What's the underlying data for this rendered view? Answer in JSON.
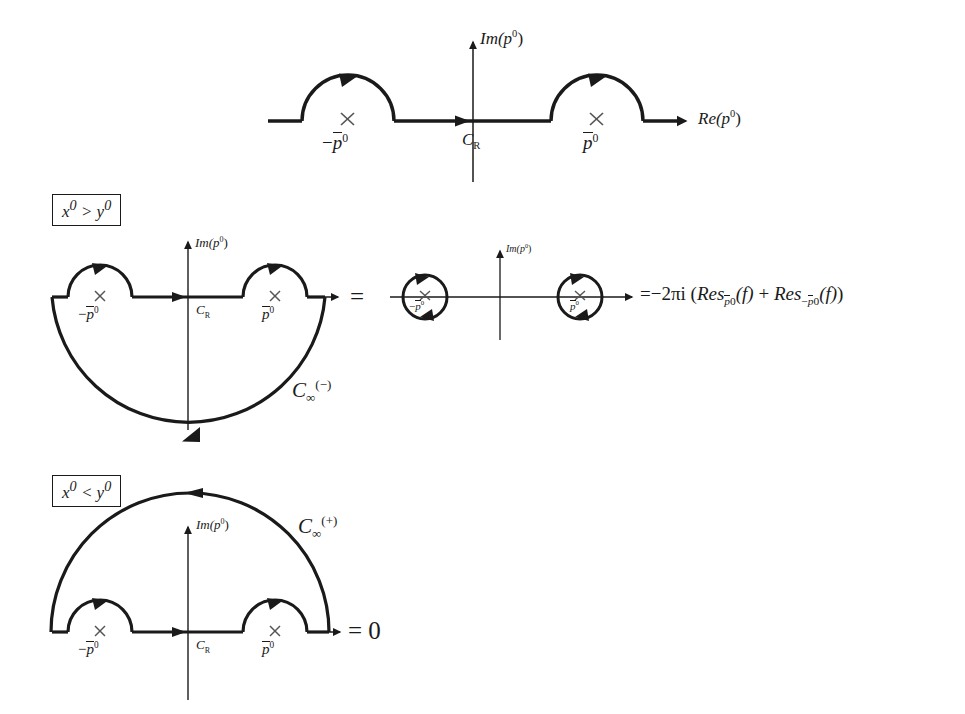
{
  "figure": {
    "background_color": "#ffffff",
    "ink_color": "#1a1a1a"
  },
  "labels": {
    "im_axis": "Im(p",
    "im_axis_sup": "0",
    "im_axis_close": ")",
    "re_axis": "Re(p",
    "re_axis_sup": "0",
    "re_axis_close": ")",
    "contour_cr": "C",
    "contour_cr_sub": "R",
    "pole_pos": "p",
    "pole_pos_sup": "0",
    "pole_neg_prefix": "−",
    "pole_neg": "p",
    "pole_neg_sup": "0",
    "c_inf": "C",
    "c_inf_sub": "∞",
    "c_inf_sup_minus": "(−)",
    "c_inf_sup_plus": "(+)",
    "equals": "=",
    "equals_zero": "= 0"
  },
  "panels": [
    {
      "id": "panel-top",
      "name": "principal-value-contour",
      "description": "Real axis with two upper small semicircular detours around the poles at -p0 and +p0",
      "condition": null,
      "has_big_arc": false,
      "big_arc_direction": null,
      "result": null
    },
    {
      "id": "panel-middle-left",
      "name": "closed-contour-lower-half",
      "description": "Contour closed in the lower half plane for x0 > y0",
      "condition": "x⁰ > y⁰",
      "condition_parts": {
        "left_var": "x",
        "left_sup": "0",
        "relation": ">",
        "right_var": "y",
        "right_sup": "0"
      },
      "has_big_arc": true,
      "big_arc_direction": "lower",
      "big_arc_label": "C_inf_minus",
      "result": null
    },
    {
      "id": "panel-middle-right",
      "name": "residue-circles",
      "description": "Two small clockwise circles enclosing the poles, equal to the residue sum",
      "condition": null,
      "has_big_arc": false,
      "result": "residue-expression"
    },
    {
      "id": "panel-bottom",
      "name": "closed-contour-upper-half",
      "description": "Contour closed in the upper half plane for x0 < y0, vanishing integral",
      "condition": "x⁰ < y⁰",
      "condition_parts": {
        "left_var": "x",
        "left_sup": "0",
        "relation": "<",
        "right_var": "y",
        "right_sup": "0"
      },
      "has_big_arc": true,
      "big_arc_direction": "upper",
      "big_arc_label": "C_inf_plus",
      "result": "= 0"
    }
  ],
  "equation": {
    "lead": "=",
    "coefficient": "−2πi",
    "open_paren": "(",
    "res_word": "Res",
    "res1_sub_bar": "p",
    "res1_sub_sup": "0",
    "arg": "(f)",
    "plus": "+",
    "res2_sub_minus": "−",
    "res2_sub_bar": "p",
    "res2_sub_sup": "0",
    "close_paren": ")",
    "full_text": "= −2πi (Res_{p̅0}(f) + Res_{−p̅0}(f))"
  },
  "geometry": {
    "panel_top": {
      "axis_y": 121,
      "axis_x_start": 268,
      "axis_x_end": 686,
      "vertical_axis_x": 473,
      "vertical_top": 38,
      "vertical_bottom": 182,
      "left_arc": {
        "cx": 348,
        "cy": 121,
        "r": 46
      },
      "right_arc": {
        "cx": 597,
        "cy": 121,
        "r": 46
      },
      "pole_left_x": 348,
      "pole_right_x": 597
    },
    "panel_mid_left": {
      "axis_y": 297,
      "axis_x_start": 52,
      "axis_x_end": 345,
      "vertical_axis_x": 188,
      "vertical_top": 238,
      "vertical_bottom": 430,
      "left_arc": {
        "cx": 100,
        "cy": 297,
        "r": 32
      },
      "right_arc": {
        "cx": 275,
        "cy": 297,
        "r": 32
      },
      "big_arc": {
        "cx": 188,
        "cy": 297,
        "r": 137
      }
    },
    "panel_mid_right": {
      "axis_y": 297,
      "axis_x_start": 390,
      "axis_x_end": 640,
      "vertical_axis_x": 500,
      "vertical_top": 247,
      "vertical_bottom": 340,
      "left_circle": {
        "cx": 425,
        "cy": 297,
        "r": 22
      },
      "right_circle": {
        "cx": 580,
        "cy": 297,
        "r": 22
      }
    },
    "panel_bottom": {
      "axis_y": 632,
      "axis_x_start": 52,
      "axis_x_end": 345,
      "vertical_axis_x": 188,
      "vertical_top": 523,
      "vertical_bottom": 700,
      "left_arc": {
        "cx": 100,
        "cy": 632,
        "r": 32
      },
      "right_arc": {
        "cx": 275,
        "cy": 632,
        "r": 32
      },
      "big_arc": {
        "cx": 190,
        "cy": 632,
        "r": 139
      }
    }
  }
}
